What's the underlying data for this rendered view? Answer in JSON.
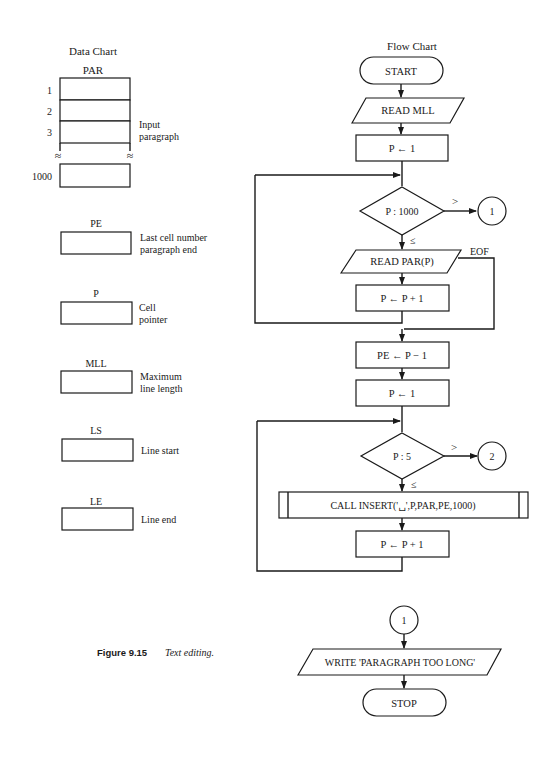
{
  "data_chart": {
    "title": "Data Chart",
    "array": {
      "name": "PAR",
      "row_labels": [
        "1",
        "2",
        "3",
        "1000"
      ],
      "break_symbol": "≈",
      "description_line1": "Input",
      "description_line2": "paragraph"
    },
    "variables": [
      {
        "name": "PE",
        "desc_line1": "Last cell number",
        "desc_line2": "paragraph end"
      },
      {
        "name": "P",
        "desc_line1": "Cell",
        "desc_line2": "pointer"
      },
      {
        "name": "MLL",
        "desc_line1": "Maximum",
        "desc_line2": "line length"
      },
      {
        "name": "LS",
        "desc_line1": "Line start",
        "desc_line2": ""
      },
      {
        "name": "LE",
        "desc_line1": "Line end",
        "desc_line2": ""
      }
    ]
  },
  "flow_chart": {
    "title": "Flow Chart",
    "start": "START",
    "read_mll": "READ MLL",
    "init_p_1": "P ← 1",
    "decision_1": "P : 1000",
    "decision_1_gt": ">",
    "decision_1_le": "≤",
    "connector_1": "1",
    "read_par": "READ PAR(P)",
    "eof_label": "EOF",
    "incr_1": "P ← P + 1",
    "set_pe": "PE ← P − 1",
    "init_p_2": "P ← 1",
    "decision_2": "P : 5",
    "decision_2_gt": ">",
    "decision_2_le": "≤",
    "connector_2": "2",
    "call_insert": "CALL INSERT('␣',P,PAR,PE,1000)",
    "incr_2": "P ← P + 1",
    "connector_1_entry": "1",
    "write_msg": "WRITE 'PARAGRAPH TOO LONG'",
    "stop": "STOP"
  },
  "caption": {
    "label": "Figure 9.15",
    "text": "Text editing."
  }
}
